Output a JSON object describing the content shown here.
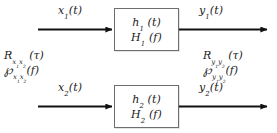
{
  "figure": {
    "type": "block-diagram",
    "background_color": "#ffffff",
    "line_color": "#111111",
    "box_border_color": "#6e6e72"
  },
  "channels": [
    {
      "id": "channel-1",
      "input_label": "x₁(t)",
      "input_symbol": "x",
      "input_subscript": "1",
      "input_argument": "(t)",
      "block": {
        "impulse_response": "h₁ (t)",
        "transfer_function": "H₁ (f)",
        "impulse_symbol": "h",
        "impulse_subscript": "1",
        "impulse_argument": "(t)",
        "transfer_symbol": "H",
        "transfer_subscript": "1",
        "transfer_argument": "(f)"
      },
      "output_label": "y₁(t)",
      "output_symbol": "y",
      "output_subscript": "1",
      "output_argument": "(t)"
    },
    {
      "id": "channel-2",
      "input_label": "x₂(t)",
      "input_symbol": "x",
      "input_subscript": "2",
      "input_argument": "(t)",
      "block": {
        "impulse_response": "h₂ (t)",
        "transfer_function": "H₂ (f)",
        "impulse_symbol": "h",
        "impulse_subscript": "2",
        "impulse_argument": "(t)",
        "transfer_symbol": "H",
        "transfer_subscript": "2",
        "transfer_argument": "(f)"
      },
      "output_label": "y₂(t)",
      "output_symbol": "y",
      "output_subscript": "2",
      "output_argument": "(t)"
    }
  ],
  "input_statistics": {
    "correlation": {
      "symbol": "R",
      "subscript": "x₁x₂",
      "argument": "(τ)",
      "full": "R x₁x₂ (τ)"
    },
    "spectral_density": {
      "symbol": "℘",
      "subscript": "x₁x₂",
      "argument": "(f)",
      "full": "℘ x₁x₂ (f)"
    }
  },
  "output_statistics": {
    "correlation": {
      "symbol": "R",
      "subscript": "y₁y₂",
      "argument": "(τ)",
      "full": "R y₁y₂ (τ)"
    },
    "spectral_density": {
      "symbol": "℘",
      "subscript": "y₁y₂",
      "argument": "(f)",
      "full": "℘ y₁y₂ (f)"
    }
  }
}
